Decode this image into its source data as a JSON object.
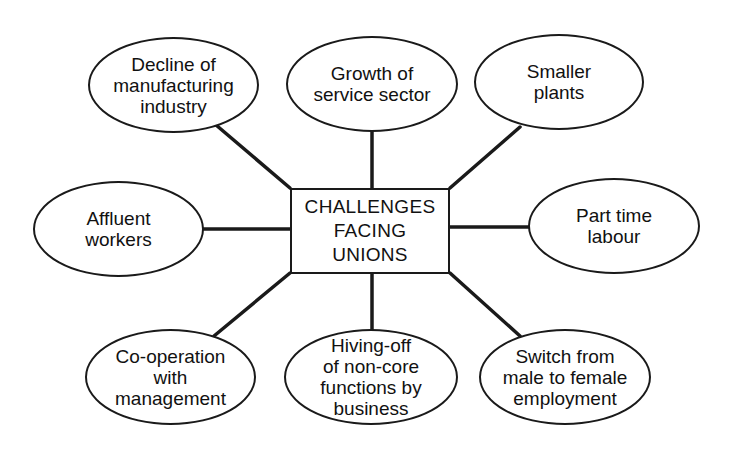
{
  "diagram": {
    "type": "spider-diagram",
    "center": {
      "label": "CHALLENGES\nFACING\nUNIONS"
    },
    "nodes": [
      {
        "id": "decline-manufacturing",
        "label": "Decline of\nmanufacturing\nindustry",
        "position": "top-left"
      },
      {
        "id": "growth-service",
        "label": "Growth of\nservice sector",
        "position": "top-center"
      },
      {
        "id": "smaller-plants",
        "label": "Smaller\nplants",
        "position": "top-right"
      },
      {
        "id": "affluent-workers",
        "label": "Affluent\nworkers",
        "position": "middle-left"
      },
      {
        "id": "part-time-labour",
        "label": "Part time\nlabour",
        "position": "middle-right"
      },
      {
        "id": "cooperation-management",
        "label": "Co-operation\nwith\nmanagement",
        "position": "bottom-left"
      },
      {
        "id": "hiving-off",
        "label": "Hiving-off\nof non-core\nfunctions by\nbusiness",
        "position": "bottom-center"
      },
      {
        "id": "male-to-female",
        "label": "Switch from\nmale to female\nemployment",
        "position": "bottom-right"
      }
    ],
    "colors": {
      "stroke": "#1a1a1a",
      "background": "#ffffff"
    }
  }
}
